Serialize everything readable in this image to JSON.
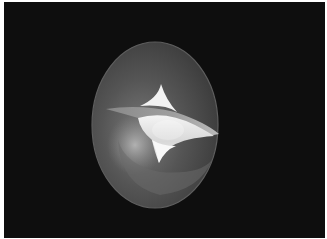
{
  "scene": {
    "description": "3D rendering of a translucent ellipsoid containing a four-cusped surface",
    "background_color": "#0e0e0e",
    "border_color": "#ffffff",
    "ellipsoid": {
      "center": [
        155,
        125
      ],
      "radii": [
        63,
        83
      ],
      "fill_color": "#4a4a4a",
      "rim_color": "#5c5c5c"
    },
    "cusp_surface": {
      "color": "#e8e8e8",
      "highlight_color": "#ffffff",
      "cusps": [
        [
          161,
          84
        ],
        [
          106,
          109
        ],
        [
          219,
          134
        ],
        [
          159,
          163
        ]
      ]
    }
  }
}
